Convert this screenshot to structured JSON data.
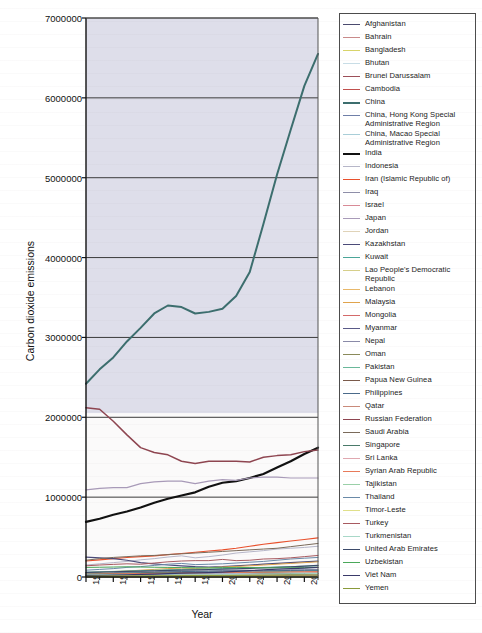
{
  "chart_data": {
    "type": "line",
    "title": "",
    "xlabel": "Year",
    "ylabel": "Carbon dioxide emissions",
    "xlim": [
      1990,
      2007
    ],
    "ylim": [
      0,
      7000000
    ],
    "grid": true,
    "legend_position": "right",
    "x_ticks": [
      "1990",
      "1992",
      "1994",
      "1996",
      "1998",
      "2000",
      "2002",
      "2004",
      "2006"
    ],
    "x_tick_values": [
      1990,
      1992,
      1994,
      1996,
      1998,
      2000,
      2002,
      2004,
      2006
    ],
    "x_minor_step": 1,
    "y_ticks": [
      "0",
      "1000000",
      "2000000",
      "3000000",
      "4000000",
      "5000000",
      "6000000",
      "7000000"
    ],
    "y_tick_values": [
      0,
      1000000,
      2000000,
      3000000,
      4000000,
      5000000,
      6000000,
      7000000
    ],
    "x": [
      1990,
      1991,
      1992,
      1993,
      1994,
      1995,
      1996,
      1997,
      1998,
      1999,
      2000,
      2001,
      2002,
      2003,
      2004,
      2005,
      2006,
      2007
    ],
    "series": [
      {
        "name": "Afghanistan",
        "color": "#4a4a6e",
        "width": 1.0,
        "values": [
          2400,
          2100,
          1600,
          1300,
          1200,
          1100,
          1050,
          1000,
          900,
          800,
          800,
          800,
          900,
          1000,
          1000,
          1000,
          1100,
          1200
        ]
      },
      {
        "name": "Bahrain",
        "color": "#c98a8a",
        "width": 1.0,
        "values": [
          11000,
          12000,
          13000,
          14000,
          14500,
          15000,
          16000,
          17000,
          17500,
          18000,
          19000,
          20000,
          21000,
          22000,
          23000,
          24000,
          25000,
          26000
        ]
      },
      {
        "name": "Bangladesh",
        "color": "#d8d46a",
        "width": 1.0,
        "values": [
          15000,
          16000,
          17000,
          18000,
          19000,
          20000,
          22000,
          23000,
          25000,
          26000,
          28000,
          30000,
          32000,
          34000,
          36000,
          39000,
          42000,
          45000
        ]
      },
      {
        "name": "Bhutan",
        "color": "#c8dde6",
        "width": 1.0,
        "values": [
          150,
          160,
          170,
          180,
          200,
          220,
          240,
          260,
          280,
          300,
          320,
          340,
          360,
          380,
          400,
          420,
          440,
          460
        ]
      },
      {
        "name": "Brunei Darussalam",
        "color": "#9c4f58",
        "width": 1.0,
        "values": [
          4500,
          4700,
          4900,
          5000,
          5100,
          5200,
          5400,
          5600,
          5800,
          6000,
          6200,
          6400,
          6600,
          6800,
          7000,
          7300,
          7600,
          8000
        ]
      },
      {
        "name": "Cambodia",
        "color": "#c0504d",
        "width": 1.0,
        "values": [
          500,
          520,
          540,
          560,
          600,
          650,
          700,
          750,
          800,
          850,
          900,
          1000,
          1100,
          1200,
          1300,
          1400,
          1500,
          1600
        ]
      },
      {
        "name": "China",
        "color": "#3c6e6e",
        "width": 2.0,
        "values": [
          2420000,
          2600000,
          2750000,
          2950000,
          3120000,
          3300000,
          3400000,
          3380000,
          3300000,
          3320000,
          3360000,
          3520000,
          3820000,
          4420000,
          5040000,
          5600000,
          6150000,
          6550000
        ]
      },
      {
        "name": "China, Hong Kong Special\nAdministrative Region",
        "color": "#6f7fa8",
        "width": 1.0,
        "values": [
          27000,
          29000,
          30000,
          31000,
          33000,
          34000,
          35000,
          36000,
          37000,
          38000,
          38500,
          38000,
          38500,
          39000,
          40000,
          41000,
          41500,
          42000
        ]
      },
      {
        "name": "China, Macao Special\nAdministrative Region",
        "color": "#a9ced8",
        "width": 1.0,
        "values": [
          900,
          950,
          1000,
          1050,
          1100,
          1150,
          1200,
          1250,
          1300,
          1350,
          1400,
          1450,
          1500,
          1600,
          1700,
          1800,
          1900,
          2000
        ]
      },
      {
        "name": "India",
        "color": "#111111",
        "width": 2.2,
        "values": [
          690000,
          730000,
          780000,
          820000,
          870000,
          930000,
          980000,
          1020000,
          1060000,
          1130000,
          1180000,
          1200000,
          1240000,
          1290000,
          1370000,
          1450000,
          1540000,
          1620000
        ]
      },
      {
        "name": "Indonesia",
        "color": "#b6b6c8",
        "width": 1.0,
        "values": [
          150000,
          165000,
          180000,
          195000,
          215000,
          230000,
          250000,
          265000,
          240000,
          255000,
          275000,
          300000,
          315000,
          330000,
          350000,
          360000,
          370000,
          385000
        ]
      },
      {
        "name": "Iran (Islamic Republic of)",
        "color": "#e8502c",
        "width": 1.1,
        "values": [
          200000,
          215000,
          230000,
          245000,
          255000,
          265000,
          280000,
          295000,
          310000,
          325000,
          340000,
          360000,
          385000,
          410000,
          430000,
          450000,
          470000,
          490000
        ]
      },
      {
        "name": "Iraq",
        "color": "#8e8ea8",
        "width": 1.0,
        "values": [
          48000,
          40000,
          55000,
          60000,
          65000,
          68000,
          70000,
          72000,
          75000,
          78000,
          80000,
          82000,
          85000,
          70000,
          85000,
          90000,
          92000,
          95000
        ]
      },
      {
        "name": "Israel",
        "color": "#d88a96",
        "width": 1.0,
        "values": [
          33000,
          36000,
          39000,
          42000,
          45000,
          48000,
          52000,
          54000,
          56000,
          58000,
          60000,
          62000,
          63000,
          64000,
          65000,
          66000,
          67000,
          68000
        ]
      },
      {
        "name": "Japan",
        "color": "#a89ab8",
        "width": 1.2,
        "values": [
          1090000,
          1110000,
          1120000,
          1120000,
          1170000,
          1190000,
          1200000,
          1200000,
          1170000,
          1200000,
          1220000,
          1210000,
          1240000,
          1250000,
          1250000,
          1240000,
          1240000,
          1240000
        ]
      },
      {
        "name": "Jordan",
        "color": "#e0d3b8",
        "width": 1.0,
        "values": [
          10000,
          11000,
          12000,
          12500,
          13000,
          13500,
          14000,
          14500,
          15000,
          15500,
          16000,
          16500,
          17000,
          17500,
          18000,
          19000,
          19500,
          20000
        ]
      },
      {
        "name": "Kazakhstan",
        "color": "#4a4a78",
        "width": 1.2,
        "values": [
          250000,
          240000,
          230000,
          210000,
          180000,
          165000,
          150000,
          140000,
          130000,
          125000,
          130000,
          140000,
          150000,
          160000,
          170000,
          180000,
          190000,
          200000
        ]
      },
      {
        "name": "Kuwait",
        "color": "#4aa598",
        "width": 1.0,
        "values": [
          32000,
          15000,
          35000,
          40000,
          42000,
          45000,
          48000,
          50000,
          52000,
          55000,
          56000,
          58000,
          60000,
          64000,
          68000,
          72000,
          76000,
          80000
        ]
      },
      {
        "name": "Lao People's Democratic\nRepublic",
        "color": "#d6cf8a",
        "width": 1.0,
        "values": [
          230,
          240,
          250,
          260,
          280,
          300,
          320,
          340,
          360,
          380,
          400,
          420,
          440,
          470,
          500,
          530,
          560,
          600
        ]
      },
      {
        "name": "Lebanon",
        "color": "#e8b86a",
        "width": 1.0,
        "values": [
          8000,
          9000,
          10000,
          11000,
          12000,
          13000,
          14000,
          14500,
          15000,
          15500,
          16000,
          16500,
          17000,
          17500,
          18000,
          18500,
          19000,
          19500
        ]
      },
      {
        "name": "Malaysia",
        "color": "#e0a44c",
        "width": 1.0,
        "values": [
          55000,
          60000,
          68000,
          75000,
          85000,
          95000,
          105000,
          112000,
          105000,
          115000,
          125000,
          132000,
          140000,
          150000,
          160000,
          170000,
          180000,
          190000
        ]
      },
      {
        "name": "Mongolia",
        "color": "#d46a6a",
        "width": 1.0,
        "values": [
          10000,
          9000,
          8000,
          7500,
          7200,
          7500,
          7800,
          8000,
          8200,
          8400,
          8600,
          8800,
          9000,
          9200,
          9500,
          10000,
          10500,
          11000
        ]
      },
      {
        "name": "Myanmar",
        "color": "#5a5a88",
        "width": 1.2,
        "values": [
          4000,
          4200,
          4400,
          4600,
          5000,
          5400,
          5800,
          6200,
          6600,
          7000,
          7500,
          8000,
          8500,
          9000,
          9500,
          10000,
          11000,
          12000
        ]
      },
      {
        "name": "Nepal",
        "color": "#8a8aa8",
        "width": 1.0,
        "values": [
          800,
          900,
          1000,
          1200,
          1400,
          1600,
          1800,
          2000,
          2200,
          2400,
          2600,
          2800,
          2900,
          3000,
          3100,
          3200,
          3300,
          3400
        ]
      },
      {
        "name": "Oman",
        "color": "#8a8a5a",
        "width": 1.0,
        "values": [
          9000,
          10000,
          11000,
          12000,
          13000,
          14000,
          15000,
          16000,
          17000,
          18000,
          19000,
          20000,
          22000,
          24000,
          28000,
          32000,
          36000,
          40000
        ]
      },
      {
        "name": "Pakistan",
        "color": "#6ab89a",
        "width": 1.0,
        "values": [
          60000,
          65000,
          70000,
          75000,
          80000,
          85000,
          90000,
          95000,
          98000,
          100000,
          105000,
          110000,
          115000,
          120000,
          125000,
          130000,
          135000,
          140000
        ]
      },
      {
        "name": "Papua New Guinea",
        "color": "#7a5a4a",
        "width": 1.0,
        "values": [
          2000,
          2100,
          2200,
          2300,
          2400,
          2500,
          2600,
          2700,
          2800,
          2900,
          3000,
          3100,
          3200,
          3300,
          3400,
          3500,
          3600,
          3700
        ]
      },
      {
        "name": "Philippines",
        "color": "#4a6a8a",
        "width": 1.0,
        "values": [
          40000,
          43000,
          46000,
          50000,
          54000,
          58000,
          64000,
          68000,
          70000,
          72000,
          75000,
          74000,
          76000,
          78000,
          80000,
          82000,
          84000,
          86000
        ]
      },
      {
        "name": "Qatar",
        "color": "#c98a7a",
        "width": 1.0,
        "values": [
          12000,
          13000,
          14000,
          15000,
          16000,
          17000,
          18000,
          19000,
          21000,
          23000,
          26000,
          29000,
          32000,
          36000,
          40000,
          44000,
          48000,
          52000
        ]
      },
      {
        "name": "Russian Federation",
        "color": "#8e4550",
        "width": 1.5,
        "values": [
          2120000,
          2100000,
          1950000,
          1780000,
          1620000,
          1560000,
          1530000,
          1450000,
          1420000,
          1450000,
          1450000,
          1450000,
          1440000,
          1500000,
          1520000,
          1530000,
          1570000,
          1590000
        ]
      },
      {
        "name": "Saudi Arabia",
        "color": "#7a6a5a",
        "width": 1.0,
        "values": [
          210000,
          230000,
          245000,
          255000,
          265000,
          270000,
          280000,
          290000,
          300000,
          310000,
          320000,
          330000,
          340000,
          350000,
          360000,
          380000,
          400000,
          420000
        ]
      },
      {
        "name": "Singapore",
        "color": "#4a7a6a",
        "width": 1.0,
        "values": [
          40000,
          43000,
          46000,
          48000,
          50000,
          52000,
          55000,
          58000,
          56000,
          58000,
          60000,
          58000,
          56000,
          52000,
          50000,
          48000,
          46000,
          45000
        ]
      },
      {
        "name": "Sri Lanka",
        "color": "#e0a8b0",
        "width": 1.0,
        "values": [
          4000,
          4200,
          4500,
          5000,
          5500,
          6000,
          6500,
          7000,
          7500,
          8000,
          9000,
          9500,
          10000,
          10500,
          11000,
          11500,
          12000,
          12500
        ]
      },
      {
        "name": "Syrian Arab Republic",
        "color": "#e87a5a",
        "width": 1.0,
        "values": [
          36000,
          38000,
          40000,
          42000,
          44000,
          46000,
          48000,
          50000,
          52000,
          54000,
          56000,
          57000,
          58000,
          60000,
          62000,
          64000,
          66000,
          68000
        ]
      },
      {
        "name": "Tajikistan",
        "color": "#9ad0a8",
        "width": 1.0,
        "values": [
          6000,
          5500,
          5000,
          4500,
          4000,
          3500,
          3200,
          3000,
          2800,
          2600,
          2400,
          2300,
          2200,
          2100,
          2100,
          2200,
          2300,
          2400
        ]
      },
      {
        "name": "Thailand",
        "color": "#6a8aa8",
        "width": 1.0,
        "values": [
          85000,
          95000,
          105000,
          120000,
          130000,
          145000,
          160000,
          170000,
          155000,
          160000,
          165000,
          175000,
          185000,
          195000,
          210000,
          225000,
          235000,
          245000
        ]
      },
      {
        "name": "Timor-Leste",
        "color": "#e0e08a",
        "width": 1.0,
        "values": [
          100,
          100,
          110,
          110,
          120,
          120,
          130,
          130,
          140,
          140,
          150,
          150,
          160,
          170,
          170,
          180,
          180,
          190
        ]
      },
      {
        "name": "Turkey",
        "color": "#a85a60",
        "width": 1.0,
        "values": [
          140000,
          150000,
          158000,
          165000,
          160000,
          175000,
          190000,
          200000,
          205000,
          205000,
          220000,
          205000,
          210000,
          225000,
          230000,
          240000,
          255000,
          270000
        ]
      },
      {
        "name": "Turkmenistan",
        "color": "#a8d8c8",
        "width": 1.0,
        "values": [
          35000,
          33000,
          30000,
          28000,
          25000,
          24000,
          25000,
          26000,
          27000,
          28000,
          30000,
          32000,
          34000,
          36000,
          38000,
          40000,
          42000,
          44000
        ]
      },
      {
        "name": "United Arab Emirates",
        "color": "#3c4a6a",
        "width": 1.2,
        "values": [
          58000,
          62000,
          66000,
          70000,
          74000,
          78000,
          82000,
          86000,
          90000,
          94000,
          98000,
          102000,
          108000,
          114000,
          120000,
          128000,
          136000,
          145000
        ]
      },
      {
        "name": "Uzbekistan",
        "color": "#4aa85a",
        "width": 1.0,
        "values": [
          120000,
          122000,
          125000,
          128000,
          125000,
          122000,
          120000,
          118000,
          116000,
          115000,
          118000,
          120000,
          118000,
          116000,
          115000,
          116000,
          118000,
          120000
        ]
      },
      {
        "name": "Viet Nam",
        "color": "#3a3a6a",
        "width": 1.2,
        "values": [
          20000,
          22000,
          25000,
          28000,
          32000,
          36000,
          42000,
          48000,
          52000,
          56000,
          62000,
          70000,
          80000,
          90000,
          98000,
          105000,
          112000,
          120000
        ]
      },
      {
        "name": "Yemen",
        "color": "#8a9a3a",
        "width": 1.0,
        "values": [
          10000,
          11000,
          12000,
          13000,
          14000,
          15000,
          16000,
          17000,
          18000,
          19000,
          20000,
          21000,
          21500,
          22000,
          22500,
          23000,
          23500,
          24000
        ]
      }
    ]
  }
}
